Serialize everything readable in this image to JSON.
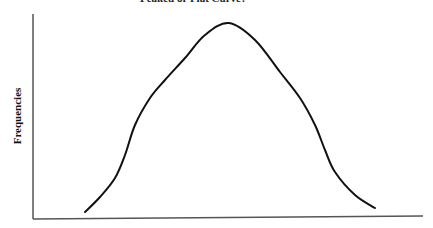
{
  "title": "Peaked or Flat Curve?",
  "chart_data": {
    "type": "line",
    "title": "Peaked or Flat Curve?",
    "xlabel": "",
    "ylabel": "Frequencies",
    "grid": false,
    "legend": null,
    "points_px": [
      [
        85,
        212
      ],
      [
        100,
        197
      ],
      [
        115,
        178
      ],
      [
        125,
        155
      ],
      [
        135,
        125
      ],
      [
        150,
        98
      ],
      [
        165,
        80
      ],
      [
        185,
        58
      ],
      [
        205,
        35
      ],
      [
        229,
        23
      ],
      [
        255,
        40
      ],
      [
        280,
        72
      ],
      [
        300,
        98
      ],
      [
        315,
        125
      ],
      [
        325,
        150
      ],
      [
        335,
        172
      ],
      [
        355,
        195
      ],
      [
        375,
        208
      ]
    ]
  },
  "colors": {
    "curve": "#111111",
    "axis": "#555555"
  }
}
